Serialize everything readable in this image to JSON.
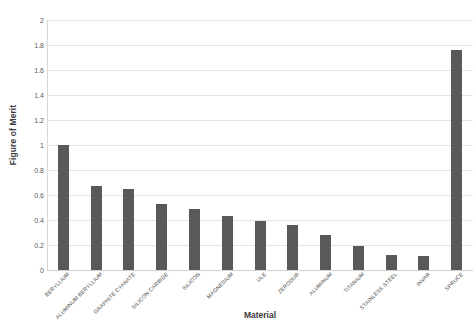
{
  "chart_data": {
    "type": "bar",
    "title": "",
    "xlabel": "Material",
    "ylabel": "Figure of Merit",
    "ylim": [
      0,
      2
    ],
    "ytick_step": 0.2,
    "yticks": [
      "2",
      "1.8",
      "1.6",
      "1.4",
      "1.2",
      "1",
      "0.8",
      "0.6",
      "0.4",
      "0.2",
      "0"
    ],
    "grid": true,
    "legend": null,
    "bar_color": "#595959",
    "categories": [
      "BERYLLIUM",
      "ALUMINUM BERYLLIUM",
      "GRAPHITE CYANATE",
      "SILICON CARBIDE",
      "SILICON",
      "MAGNESIUM",
      "ULE",
      "ZERODUR",
      "ALUMINUM",
      "TITANIUM",
      "STAINLESS STEEL",
      "INVAR",
      "SPRUCE"
    ],
    "values": [
      1.0,
      0.67,
      0.65,
      0.53,
      0.49,
      0.43,
      0.39,
      0.36,
      0.28,
      0.19,
      0.12,
      0.11,
      1.76
    ]
  }
}
